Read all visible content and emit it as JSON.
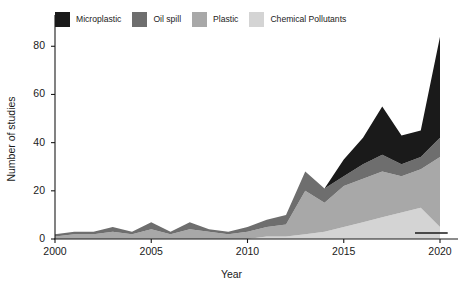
{
  "chart_data": {
    "type": "area",
    "stacked": true,
    "title": "",
    "subtitle": "",
    "xlabel": "Year",
    "ylabel": "Number of studies",
    "xlim": [
      2000,
      2020
    ],
    "ylim": [
      0,
      88
    ],
    "xticks": [
      2000,
      2005,
      2010,
      2015,
      2020
    ],
    "yticks": [
      0,
      20,
      40,
      60,
      80
    ],
    "grid": false,
    "legend_position": "top-left",
    "x": [
      2000,
      2001,
      2002,
      2003,
      2004,
      2005,
      2006,
      2007,
      2008,
      2009,
      2010,
      2011,
      2012,
      2013,
      2014,
      2015,
      2016,
      2017,
      2018,
      2019,
      2020
    ],
    "series": [
      {
        "name": "Chemical Pollutants",
        "color": "#d4d4d4",
        "values": [
          0,
          0,
          0,
          0,
          0,
          0,
          0,
          0,
          0,
          0,
          0,
          1,
          1,
          2,
          3,
          5,
          7,
          9,
          11,
          13,
          5
        ]
      },
      {
        "name": "Plastic",
        "color": "#a8a8a8",
        "values": [
          1,
          2,
          2,
          3,
          2,
          4,
          2,
          4,
          3,
          2,
          3,
          4,
          5,
          18,
          12,
          17,
          18,
          19,
          15,
          16,
          29
        ]
      },
      {
        "name": "Oil spill",
        "color": "#6e6e6e",
        "values": [
          1,
          1,
          1,
          2,
          1,
          3,
          1,
          3,
          1,
          1,
          2,
          3,
          4,
          8,
          6,
          4,
          6,
          7,
          5,
          5,
          8
        ]
      },
      {
        "name": "Microplastic",
        "color": "#1a1a1a",
        "values": [
          0,
          0,
          0,
          0,
          0,
          0,
          0,
          0,
          0,
          0,
          0,
          0,
          0,
          0,
          0,
          7,
          11,
          20,
          12,
          11,
          42
        ]
      }
    ],
    "totals": [
      2,
      3,
      3,
      5,
      3,
      7,
      3,
      7,
      4,
      3,
      5,
      8,
      10,
      28,
      21,
      33,
      42,
      55,
      43,
      45,
      84
    ],
    "annotations": [
      {
        "name": "baseline-marker",
        "type": "horizontal-rule",
        "x_start": 2018.7,
        "x_end": 2020.4,
        "y": 0
      }
    ]
  },
  "legend": {
    "items": [
      {
        "label": "Microplastic",
        "color": "#1a1a1a"
      },
      {
        "label": "Oil spill",
        "color": "#6e6e6e"
      },
      {
        "label": "Plastic",
        "color": "#a8a8a8"
      },
      {
        "label": "Chemical Pollutants",
        "color": "#d4d4d4"
      }
    ]
  },
  "axes": {
    "y_label": "Number of studies",
    "x_label": "Year",
    "y_ticks": [
      "0",
      "20",
      "40",
      "60",
      "80"
    ],
    "x_ticks": [
      "2000",
      "2005",
      "2010",
      "2015",
      "2020"
    ]
  }
}
